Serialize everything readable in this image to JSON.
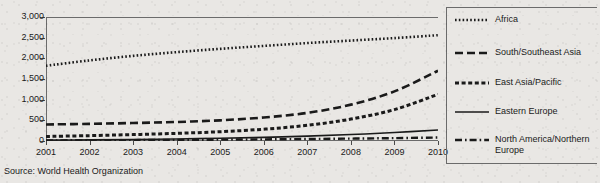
{
  "chart_data": {
    "type": "line",
    "title": "",
    "xlabel": "",
    "ylabel": "",
    "x": [
      2001,
      2002,
      2003,
      2004,
      2005,
      2006,
      2007,
      2008,
      2009,
      2010
    ],
    "categories": [
      "2001",
      "2002",
      "2003",
      "2004",
      "2005",
      "2006",
      "2007",
      "2008",
      "2009",
      "2010"
    ],
    "ylim": [
      0,
      3000
    ],
    "ytick_values": [
      0,
      500,
      1000,
      1500,
      2000,
      2500,
      3000
    ],
    "ytick_labels": [
      "0",
      "500",
      "1,000",
      "1,500",
      "2,000",
      "2,500",
      "3,000"
    ],
    "grid": false,
    "legend_position": "right",
    "series": [
      {
        "name": "Africa",
        "line_style": "dotted",
        "values": [
          1820,
          1950,
          2060,
          2150,
          2230,
          2300,
          2370,
          2430,
          2490,
          2560
        ]
      },
      {
        "name": "South/Southeast Asia",
        "line_style": "dashed-long",
        "values": [
          400,
          415,
          435,
          460,
          500,
          570,
          680,
          880,
          1200,
          1700
        ]
      },
      {
        "name": "East Asia/Pacific",
        "line_style": "dashed-short",
        "values": [
          110,
          130,
          155,
          185,
          225,
          285,
          380,
          530,
          760,
          1130
        ]
      },
      {
        "name": "Eastern Europe",
        "line_style": "solid",
        "values": [
          20,
          28,
          38,
          50,
          66,
          88,
          118,
          156,
          205,
          265
        ]
      },
      {
        "name": "North America/Northern Europe",
        "line_style": "dash-dot",
        "values": [
          15,
          18,
          22,
          27,
          33,
          40,
          48,
          58,
          70,
          84
        ]
      }
    ]
  },
  "legend": {
    "items": [
      {
        "label": "Africa"
      },
      {
        "label": "South/Southeast Asia"
      },
      {
        "label": "East Asia/Pacific"
      },
      {
        "label": "Eastern Europe"
      },
      {
        "label": "North America/Northern Europe"
      }
    ]
  },
  "source": {
    "text": "Source: World Health Organization"
  },
  "colors": {
    "ink": "#1a1a1a",
    "axis": "#6b6b6b",
    "paper": "#e9e7e4"
  }
}
